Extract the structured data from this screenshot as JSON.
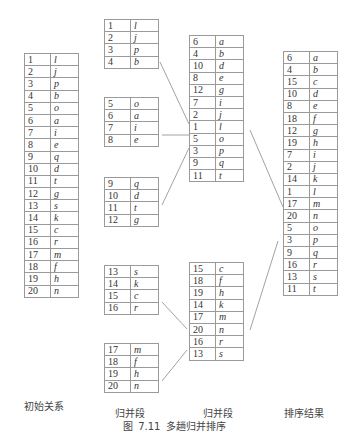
{
  "caption": "图 7.11   多趟归并排序",
  "labels": {
    "initial": "初始关系",
    "merge1": "归并段",
    "merge2": "归并段",
    "result": "排序结果"
  },
  "initial": [
    [
      "1",
      "l"
    ],
    [
      "2",
      "j"
    ],
    [
      "3",
      "p"
    ],
    [
      "4",
      "b"
    ],
    [
      "5",
      "o"
    ],
    [
      "6",
      "a"
    ],
    [
      "7",
      "i"
    ],
    [
      "8",
      "e"
    ],
    [
      "9",
      "q"
    ],
    [
      "10",
      "d"
    ],
    [
      "11",
      "t"
    ],
    [
      "12",
      "g"
    ],
    [
      "13",
      "s"
    ],
    [
      "14",
      "k"
    ],
    [
      "15",
      "c"
    ],
    [
      "16",
      "r"
    ],
    [
      "17",
      "m"
    ],
    [
      "18",
      "f"
    ],
    [
      "19",
      "h"
    ],
    [
      "20",
      "n"
    ]
  ],
  "runs": [
    [
      [
        "1",
        "l"
      ],
      [
        "2",
        "j"
      ],
      [
        "3",
        "p"
      ],
      [
        "4",
        "b"
      ]
    ],
    [
      [
        "5",
        "o"
      ],
      [
        "6",
        "a"
      ],
      [
        "7",
        "i"
      ],
      [
        "8",
        "e"
      ]
    ],
    [
      [
        "9",
        "q"
      ],
      [
        "10",
        "d"
      ],
      [
        "11",
        "t"
      ],
      [
        "12",
        "g"
      ]
    ],
    [
      [
        "13",
        "s"
      ],
      [
        "14",
        "k"
      ],
      [
        "15",
        "c"
      ],
      [
        "16",
        "r"
      ]
    ],
    [
      [
        "17",
        "m"
      ],
      [
        "18",
        "f"
      ],
      [
        "19",
        "h"
      ],
      [
        "20",
        "n"
      ]
    ]
  ],
  "merged": [
    [
      [
        "6",
        "a"
      ],
      [
        "4",
        "b"
      ],
      [
        "10",
        "d"
      ],
      [
        "8",
        "e"
      ],
      [
        "12",
        "g"
      ],
      [
        "7",
        "i"
      ],
      [
        "2",
        "j"
      ],
      [
        "1",
        "l"
      ],
      [
        "5",
        "o"
      ],
      [
        "3",
        "p"
      ],
      [
        "9",
        "q"
      ],
      [
        "11",
        "t"
      ]
    ],
    [
      [
        "15",
        "c"
      ],
      [
        "18",
        "f"
      ],
      [
        "19",
        "h"
      ],
      [
        "14",
        "k"
      ],
      [
        "17",
        "m"
      ],
      [
        "20",
        "n"
      ],
      [
        "16",
        "r"
      ],
      [
        "13",
        "s"
      ]
    ]
  ],
  "result": [
    [
      "6",
      "a"
    ],
    [
      "4",
      "b"
    ],
    [
      "15",
      "c"
    ],
    [
      "10",
      "d"
    ],
    [
      "8",
      "e"
    ],
    [
      "18",
      "f"
    ],
    [
      "12",
      "g"
    ],
    [
      "19",
      "h"
    ],
    [
      "7",
      "i"
    ],
    [
      "2",
      "j"
    ],
    [
      "14",
      "k"
    ],
    [
      "1",
      "l"
    ],
    [
      "17",
      "m"
    ],
    [
      "20",
      "n"
    ],
    [
      "5",
      "o"
    ],
    [
      "3",
      "p"
    ],
    [
      "9",
      "q"
    ],
    [
      "16",
      "r"
    ],
    [
      "13",
      "s"
    ],
    [
      "11",
      "t"
    ]
  ]
}
